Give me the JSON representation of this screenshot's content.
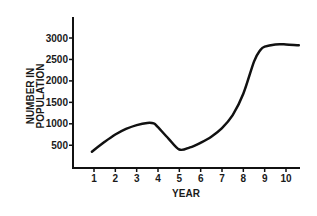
{
  "chart_data": {
    "type": "line",
    "title": "",
    "xlabel": "YEAR",
    "ylabel": "NUMBER IN POPULATION",
    "x_ticks": [
      "1",
      "2",
      "3",
      "4",
      "5",
      "6",
      "7",
      "8",
      "9",
      "10"
    ],
    "y_ticks": [
      "500",
      "1000",
      "1500",
      "2000",
      "2500",
      "3000"
    ],
    "xlim": [
      0,
      10.7
    ],
    "ylim": [
      0,
      3500
    ],
    "grid": false,
    "legend": null,
    "series": [
      {
        "name": "Population",
        "x": [
          0.9,
          1.5,
          2,
          2.5,
          3,
          3.5,
          3.8,
          4,
          4.5,
          5,
          5.5,
          6,
          6.5,
          7,
          7.5,
          8,
          8.5,
          8.8,
          9,
          9.5,
          10,
          10.6
        ],
        "y": [
          350,
          580,
          750,
          880,
          970,
          1020,
          1010,
          920,
          650,
          400,
          450,
          560,
          700,
          900,
          1200,
          1700,
          2450,
          2720,
          2800,
          2850,
          2850,
          2830
        ]
      }
    ]
  }
}
